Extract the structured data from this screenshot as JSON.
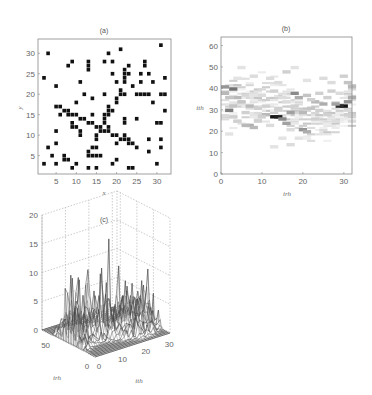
{
  "chart_data": [
    {
      "panel": "a",
      "type": "scatter",
      "title": "(a)",
      "xlabel": "x",
      "ylabel": "y",
      "xlim": [
        0.5,
        33.5
      ],
      "ylim": [
        0.5,
        33.5
      ],
      "xticks": [
        5,
        10,
        15,
        20,
        25,
        30
      ],
      "yticks": [
        5,
        10,
        15,
        20,
        25,
        30
      ],
      "grid": false,
      "marker": "filled-square",
      "points": [
        [
          3,
          30
        ],
        [
          18,
          30
        ],
        [
          21,
          31
        ],
        [
          31,
          32
        ],
        [
          8,
          27
        ],
        [
          9,
          28
        ],
        [
          13,
          26
        ],
        [
          13,
          27
        ],
        [
          13,
          28
        ],
        [
          17,
          28
        ],
        [
          19,
          28
        ],
        [
          27,
          27
        ],
        [
          27,
          28
        ],
        [
          23,
          27
        ],
        [
          22,
          26
        ],
        [
          2,
          24
        ],
        [
          19,
          25
        ],
        [
          22,
          25
        ],
        [
          23,
          25
        ],
        [
          26,
          25
        ],
        [
          28,
          25
        ],
        [
          32,
          24
        ],
        [
          5,
          22
        ],
        [
          11,
          23
        ],
        [
          20,
          23
        ],
        [
          22,
          23
        ],
        [
          22,
          24
        ],
        [
          26,
          23
        ],
        [
          29,
          23
        ],
        [
          24,
          22
        ],
        [
          12,
          20
        ],
        [
          14,
          19
        ],
        [
          17,
          20
        ],
        [
          21,
          21
        ],
        [
          21,
          20
        ],
        [
          22,
          20
        ],
        [
          25,
          20
        ],
        [
          26,
          20
        ],
        [
          27,
          20
        ],
        [
          28,
          20
        ],
        [
          31,
          20
        ],
        [
          32,
          20
        ],
        [
          10,
          18
        ],
        [
          20,
          19
        ],
        [
          20,
          18
        ],
        [
          29,
          18
        ],
        [
          32,
          16
        ],
        [
          5,
          17
        ],
        [
          6,
          17
        ],
        [
          7,
          16
        ],
        [
          8,
          16
        ],
        [
          8,
          15
        ],
        [
          9,
          15
        ],
        [
          10,
          15
        ],
        [
          6,
          15
        ],
        [
          11,
          14
        ],
        [
          12,
          14
        ],
        [
          18,
          17
        ],
        [
          19,
          16
        ],
        [
          18,
          16
        ],
        [
          18,
          15
        ],
        [
          17,
          15
        ],
        [
          17,
          14
        ],
        [
          14,
          15
        ],
        [
          13,
          13
        ],
        [
          14,
          13
        ],
        [
          9,
          13
        ],
        [
          9,
          12
        ],
        [
          10,
          12
        ],
        [
          11,
          11
        ],
        [
          11,
          10
        ],
        [
          22,
          14
        ],
        [
          22,
          13
        ],
        [
          25,
          14
        ],
        [
          30,
          13
        ],
        [
          31,
          13
        ],
        [
          15,
          12
        ],
        [
          16,
          12
        ],
        [
          16,
          11
        ],
        [
          17,
          11
        ],
        [
          18,
          11
        ],
        [
          17,
          13
        ],
        [
          18,
          12
        ],
        [
          19,
          10
        ],
        [
          20,
          10
        ],
        [
          21,
          9
        ],
        [
          22,
          10
        ],
        [
          22,
          9
        ],
        [
          23,
          9
        ],
        [
          23,
          8
        ],
        [
          24,
          8
        ],
        [
          25,
          7
        ],
        [
          5,
          11
        ],
        [
          15,
          9
        ],
        [
          15,
          10
        ],
        [
          20,
          8
        ],
        [
          28,
          9
        ],
        [
          31,
          9
        ],
        [
          31,
          7
        ],
        [
          28,
          6
        ],
        [
          3,
          7
        ],
        [
          5,
          8
        ],
        [
          4,
          5
        ],
        [
          7,
          5
        ],
        [
          7,
          4
        ],
        [
          8,
          4
        ],
        [
          13,
          6
        ],
        [
          13,
          5
        ],
        [
          14,
          7
        ],
        [
          14,
          5
        ],
        [
          15,
          7
        ],
        [
          15,
          5
        ],
        [
          16,
          5
        ],
        [
          2,
          3
        ],
        [
          5,
          3
        ],
        [
          9,
          2
        ],
        [
          10,
          3
        ],
        [
          13,
          2
        ],
        [
          15,
          2
        ],
        [
          19,
          3
        ],
        [
          20,
          4
        ],
        [
          23,
          2
        ],
        [
          24,
          2
        ],
        [
          30,
          3
        ]
      ]
    },
    {
      "panel": "b",
      "type": "heatmap",
      "title": "(b)",
      "xlabel": "irh",
      "ylabel": "ith",
      "xlim": [
        0,
        32
      ],
      "ylim": [
        0,
        64
      ],
      "xticks": [
        0,
        10,
        20,
        30
      ],
      "yticks": [
        0,
        10,
        20,
        30,
        40,
        50,
        60
      ],
      "colormap": "gray-inverted",
      "description": "Sparse grayscale intensity band between ith≈12 and ith≈52; dark cells around (12,26), (29,31), (2,39), (1,29), (17,37)",
      "cells": [
        {
          "x": 12,
          "y": 26,
          "v": 1.0
        },
        {
          "x": 13,
          "y": 26,
          "v": 0.95
        },
        {
          "x": 29,
          "y": 31,
          "v": 1.0
        },
        {
          "x": 28,
          "y": 31,
          "v": 0.9
        },
        {
          "x": 2,
          "y": 39,
          "v": 0.6
        },
        {
          "x": 1,
          "y": 29,
          "v": 0.55
        },
        {
          "x": 0,
          "y": 40,
          "v": 0.45
        },
        {
          "x": 17,
          "y": 37,
          "v": 0.5
        },
        {
          "x": 14,
          "y": 25,
          "v": 0.5
        },
        {
          "x": 15,
          "y": 23,
          "v": 0.4
        },
        {
          "x": 19,
          "y": 20,
          "v": 0.45
        },
        {
          "x": 20,
          "y": 19,
          "v": 0.35
        },
        {
          "x": 6,
          "y": 22,
          "v": 0.35
        },
        {
          "x": 7,
          "y": 21,
          "v": 0.3
        },
        {
          "x": 5,
          "y": 22,
          "v": 0.3
        },
        {
          "x": 16,
          "y": 28,
          "v": 0.4
        },
        {
          "x": 10,
          "y": 27,
          "v": 0.3
        },
        {
          "x": 30,
          "y": 33,
          "v": 0.45
        },
        {
          "x": 31,
          "y": 35,
          "v": 0.35
        },
        {
          "x": 27,
          "y": 32,
          "v": 0.4
        },
        {
          "x": 24,
          "y": 32,
          "v": 0.35
        },
        {
          "x": 22,
          "y": 33,
          "v": 0.3
        },
        {
          "x": 18,
          "y": 35,
          "v": 0.35
        },
        {
          "x": 20,
          "y": 36,
          "v": 0.25
        },
        {
          "x": 3,
          "y": 35,
          "v": 0.3
        },
        {
          "x": 4,
          "y": 33,
          "v": 0.25
        },
        {
          "x": 6,
          "y": 31,
          "v": 0.3
        },
        {
          "x": 8,
          "y": 30,
          "v": 0.2
        },
        {
          "x": 1,
          "y": 35,
          "v": 0.25
        },
        {
          "x": 0,
          "y": 37,
          "v": 0.3
        },
        {
          "x": 2,
          "y": 26,
          "v": 0.2
        },
        {
          "x": 3,
          "y": 24,
          "v": 0.2
        },
        {
          "x": 31,
          "y": 40,
          "v": 0.3
        },
        {
          "x": 30,
          "y": 42,
          "v": 0.25
        },
        {
          "x": 29,
          "y": 45,
          "v": 0.2
        },
        {
          "x": 26,
          "y": 38,
          "v": 0.2
        },
        {
          "x": 23,
          "y": 37,
          "v": 0.2
        },
        {
          "x": 21,
          "y": 30,
          "v": 0.25
        },
        {
          "x": 19,
          "y": 28,
          "v": 0.3
        },
        {
          "x": 17,
          "y": 31,
          "v": 0.2
        },
        {
          "x": 14,
          "y": 35,
          "v": 0.15
        },
        {
          "x": 12,
          "y": 38,
          "v": 0.2
        },
        {
          "x": 9,
          "y": 36,
          "v": 0.15
        },
        {
          "x": 11,
          "y": 44,
          "v": 0.15
        },
        {
          "x": 15,
          "y": 47,
          "v": 0.2
        },
        {
          "x": 7,
          "y": 45,
          "v": 0.15
        },
        {
          "x": 4,
          "y": 49,
          "v": 0.12
        },
        {
          "x": 17,
          "y": 49,
          "v": 0.12
        },
        {
          "x": 24,
          "y": 44,
          "v": 0.15
        },
        {
          "x": 26,
          "y": 42,
          "v": 0.15
        },
        {
          "x": 13,
          "y": 42,
          "v": 0.15
        },
        {
          "x": 10,
          "y": 31,
          "v": 0.2
        },
        {
          "x": 8,
          "y": 24,
          "v": 0.2
        },
        {
          "x": 11,
          "y": 22,
          "v": 0.15
        },
        {
          "x": 16,
          "y": 20,
          "v": 0.15
        },
        {
          "x": 18,
          "y": 16,
          "v": 0.12
        },
        {
          "x": 16,
          "y": 13,
          "v": 0.15
        },
        {
          "x": 12,
          "y": 12,
          "v": 0.12
        },
        {
          "x": 14,
          "y": 16,
          "v": 0.12
        },
        {
          "x": 22,
          "y": 25,
          "v": 0.2
        },
        {
          "x": 25,
          "y": 27,
          "v": 0.2
        },
        {
          "x": 27,
          "y": 24,
          "v": 0.15
        },
        {
          "x": 30,
          "y": 27,
          "v": 0.2
        },
        {
          "x": 31,
          "y": 24,
          "v": 0.15
        },
        {
          "x": 2,
          "y": 31,
          "v": 0.25
        },
        {
          "x": 5,
          "y": 28,
          "v": 0.2
        },
        {
          "x": 9,
          "y": 26,
          "v": 0.2
        },
        {
          "x": 13,
          "y": 30,
          "v": 0.2
        },
        {
          "x": 15,
          "y": 33,
          "v": 0.15
        },
        {
          "x": 21,
          "y": 34,
          "v": 0.2
        },
        {
          "x": 23,
          "y": 29,
          "v": 0.2
        },
        {
          "x": 25,
          "y": 35,
          "v": 0.2
        },
        {
          "x": 28,
          "y": 37,
          "v": 0.15
        },
        {
          "x": 1,
          "y": 18,
          "v": 0.12
        },
        {
          "x": 3,
          "y": 44,
          "v": 0.12
        },
        {
          "x": 20,
          "y": 43,
          "v": 0.12
        }
      ]
    },
    {
      "panel": "c",
      "type": "surface3d",
      "title": "(c)",
      "xlabel": "ith",
      "ylabel": "irh",
      "zlabel": "",
      "zlim": [
        0,
        20
      ],
      "zticks": [
        0,
        5,
        10,
        15,
        20
      ],
      "xticks": [
        0,
        10,
        20,
        30
      ],
      "yticks": [
        0,
        50
      ],
      "grid": true,
      "description": "Wireframe mesh surface of the (b) intensity; peaks up to ~15 near ith≈20, ith≈12 around 12; typical heights 2–8"
    }
  ]
}
